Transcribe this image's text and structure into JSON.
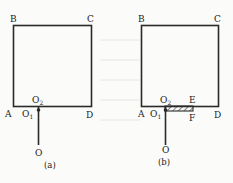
{
  "figures": [
    {
      "id": "a",
      "caption": "(a)",
      "labels": {
        "B": "B",
        "C": "C",
        "A": "A",
        "D": "D",
        "O1": "O",
        "O1_sub": "1",
        "O2": "O",
        "O2_sub": "2",
        "O": "O"
      }
    },
    {
      "id": "b",
      "caption": "(b)",
      "labels": {
        "B": "B",
        "C": "C",
        "A": "A",
        "D": "D",
        "O1": "O",
        "O1_sub": "1",
        "O2": "O",
        "O2_sub": "2",
        "E": "E",
        "F": "F",
        "O": "O"
      }
    }
  ],
  "colors": {
    "line": "#2a2a2a",
    "text": "#222222"
  }
}
